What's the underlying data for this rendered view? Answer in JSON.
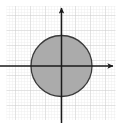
{
  "chart_data": {
    "type": "scatter",
    "title": "",
    "subtitle": "",
    "xlabel": "",
    "ylabel": "",
    "grid": true,
    "legend": false,
    "legend_position": "none",
    "axes_style": "arrows-through-origin",
    "x_axis": {
      "label": "",
      "tick_labels": [],
      "origin_px": 61.5,
      "range_px": [
        0,
        120
      ],
      "arrow": "right",
      "arrow_end_px": 114,
      "line_start_px": 0
    },
    "y_axis": {
      "label": "",
      "tick_labels": [],
      "origin_px": 66,
      "range_px": [
        0,
        123
      ],
      "arrow": "up",
      "arrow_end_px": 5,
      "line_end_px": 123
    },
    "gridlines": {
      "minor_spacing_px": 3,
      "major_spacing_px": 15,
      "minor_color": "#e2e2e2",
      "major_color": "#c9c9c9",
      "extent_px": {
        "x0": 5,
        "y0": 8,
        "x1": 116,
        "y1": 119
      }
    },
    "shapes": [
      {
        "name": "disk",
        "type": "circle",
        "center": [
          0,
          0
        ],
        "center_px": [
          61.5,
          66
        ],
        "radius_px": 30.5,
        "fill": "#ababab",
        "fill_opacity": 1,
        "stroke": "#3a3a3a",
        "stroke_width_px": 1.3,
        "label": ""
      }
    ],
    "series": [],
    "annotations": [],
    "colors": {
      "background": "#ffffff",
      "axis": "#1a1a1a",
      "shape_fill": "#ababab",
      "shape_stroke": "#3a3a3a",
      "grid_minor": "#e2e2e2",
      "grid_major": "#c9c9c9"
    }
  }
}
